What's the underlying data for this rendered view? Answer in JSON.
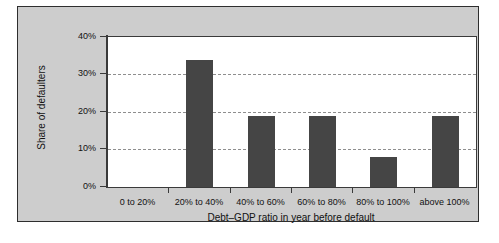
{
  "chart_data": {
    "type": "bar",
    "title": "",
    "subtitle": "",
    "xlabel": "Debt–GDP ratio in year before default",
    "ylabel": "Share of defaulters",
    "categories": [
      "0 to 20%",
      "20% to 40%",
      "40% to 60%",
      "60% to 80%",
      "80% to 100%",
      "above 100%"
    ],
    "values": [
      0,
      34,
      19,
      19,
      8,
      19
    ],
    "value_unit": "percent",
    "ylim": [
      0,
      40
    ],
    "ytick_values": [
      0,
      10,
      20,
      30,
      40
    ],
    "ytick_labels": [
      "0%",
      "10%",
      "20%",
      "30%",
      "40%"
    ],
    "grid": "horizontal dashed gridlines at 10%, 20%, 30%",
    "legend": "none",
    "series": [
      {
        "name": "Share of defaulters",
        "values": [
          0,
          34,
          19,
          19,
          8,
          19
        ]
      }
    ],
    "colors": {
      "bar": "#454545",
      "plot_background": "#ffffff",
      "panel_background": "#cdcdcd",
      "axis": "#3a3a3a",
      "gridline": "#8e8e8e",
      "text": "#111111"
    }
  },
  "axis": {
    "y_labels": [
      "40%",
      "30%",
      "20%",
      "10%",
      "0%"
    ],
    "x_labels": [
      "0 to 20%",
      "20% to 40%",
      "40% to 60%",
      "60% to 80%",
      "80% to 100%",
      "above 100%"
    ],
    "y_title": "Share of defaulters",
    "x_title": "Debt–GDP ratio in year before default"
  }
}
